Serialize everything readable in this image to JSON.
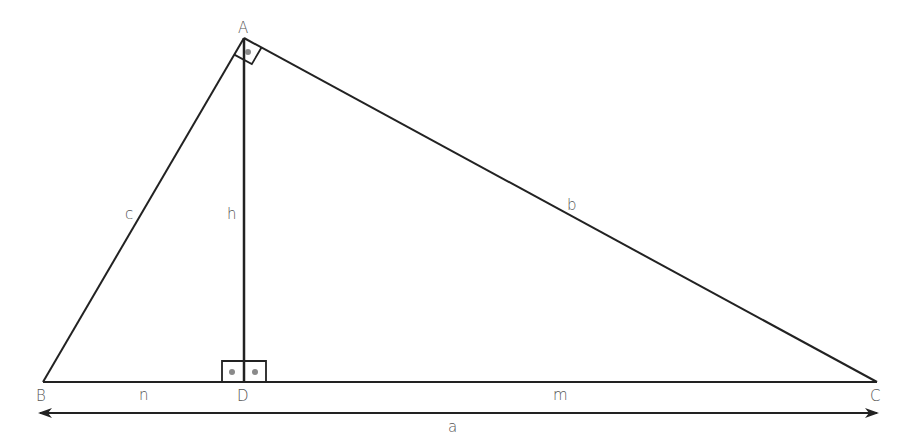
{
  "diagram": {
    "type": "right-triangle-altitude",
    "colors": {
      "line": "#222222",
      "label": "#555555",
      "dot": "#8a8a8a",
      "background": "#ffffff"
    },
    "vertices": {
      "A": {
        "label": "A",
        "x": 244,
        "y": 38
      },
      "B": {
        "label": "B",
        "x": 43,
        "y": 382
      },
      "C": {
        "label": "C",
        "x": 877,
        "y": 382
      },
      "D": {
        "label": "D",
        "x": 244,
        "y": 382
      }
    },
    "segment_labels": {
      "c": "c",
      "b": "b",
      "h": "h",
      "n": "n",
      "m": "m",
      "a": "a"
    },
    "annotations": {
      "right_angle_at_A": true,
      "right_angles_at_D": 2,
      "double_arrow_label": "a"
    }
  }
}
